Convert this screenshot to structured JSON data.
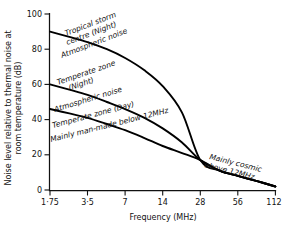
{
  "chart_data": {
    "type": "line",
    "title": "",
    "subtitle": "",
    "xlabel": "Frequency (MHz)",
    "ylabel": "Noise level relative to thermal noise at room temperature (dB)",
    "x_tick_labels": [
      "1·75",
      "3·5",
      "7",
      "14",
      "28",
      "56",
      "112"
    ],
    "x_tick_values": [
      1.75,
      3.5,
      7,
      14,
      28,
      56,
      112
    ],
    "x_scale": "log2",
    "xlim": [
      1.75,
      112
    ],
    "y_tick_labels": [
      "0",
      "20",
      "40",
      "60",
      "80",
      "100"
    ],
    "y_tick_values": [
      0,
      20,
      40,
      60,
      80,
      100
    ],
    "ylim": [
      0,
      100
    ],
    "grid": false,
    "legend": "none",
    "legend_position": "inline-annotations",
    "series": [
      {
        "name": "Tropical storm centre (Night) — Atmospheric noise",
        "x": [
          1.75,
          2.5,
          3.5,
          5,
          7,
          10,
          14,
          20,
          28,
          40,
          56,
          80,
          112
        ],
        "values": [
          90,
          87,
          84,
          80,
          75,
          68,
          59,
          44,
          17,
          11,
          8,
          5,
          2
        ]
      },
      {
        "name": "Temperate zone (Night) — Atmospheric noise",
        "x": [
          1.75,
          2.5,
          3.5,
          5,
          7,
          10,
          14,
          20,
          28,
          40,
          56,
          80,
          112
        ],
        "values": [
          60,
          57,
          54,
          50,
          46,
          41,
          35,
          27,
          17,
          11,
          8,
          5,
          2
        ]
      },
      {
        "name": "Temperate zone (Day) — Mainly man-made below 12MHz",
        "x": [
          1.75,
          2.5,
          3.5,
          5,
          7,
          10,
          14,
          20,
          28,
          40,
          56,
          80,
          112
        ],
        "values": [
          46,
          43.5,
          41,
          37.5,
          34,
          29.5,
          25,
          21,
          17,
          11,
          8,
          5,
          2
        ]
      }
    ],
    "annotations": [
      {
        "id": "tropical-storm-centre",
        "lines": [
          "Tropical storm",
          "centre (Night)"
        ],
        "x": 2.9,
        "y": 88,
        "rotation": -21
      },
      {
        "id": "atmospheric-noise-upper",
        "lines": [
          "Atmospheric noise"
        ],
        "x": 2.7,
        "y": 79,
        "rotation": -21
      },
      {
        "id": "temperate-zone-night",
        "lines": [
          "Temperate zone",
          "(Night)"
        ],
        "x": 2.6,
        "y": 62,
        "rotation": -19
      },
      {
        "id": "atmospheric-noise-lower",
        "lines": [
          "Atmospheric noise"
        ],
        "x": 2.4,
        "y": 49,
        "rotation": -17
      },
      {
        "id": "temperate-zone-day",
        "lines": [
          "Temperate zone (Day)"
        ],
        "x": 2.3,
        "y": 42,
        "rotation": -15
      },
      {
        "id": "mainly-man-made",
        "lines": [
          "Mainly man-made below 12MHz"
        ],
        "x": 2.2,
        "y": 35,
        "rotation": -14
      },
      {
        "id": "mainly-cosmic",
        "lines": [
          "Mainly cosmic",
          "above 12MHz"
        ],
        "x": 36,
        "y": 15,
        "rotation": 14
      }
    ]
  },
  "axes": {
    "x_title": "Frequency (MHz)",
    "y_title_line1": "Noise level relative to thermal noise at",
    "y_title_line2": "room temperature (dB)",
    "x_ticks": [
      "1·75",
      "3·5",
      "7",
      "14",
      "28",
      "56",
      "112"
    ],
    "y_ticks": [
      "100",
      "80",
      "60",
      "40",
      "20",
      "0"
    ]
  },
  "annotation_text": {
    "tropical_storm_l1": "Tropical storm",
    "tropical_storm_l2": "centre (Night)",
    "atmospheric_noise_upper": "Atmospheric noise",
    "temperate_night_l1": "Temperate zone",
    "temperate_night_l2": "(Night)",
    "atmospheric_noise_lower": "Atmospheric noise",
    "temperate_day": "Temperate zone (Day)",
    "man_made": "Mainly man-made below 12MHz",
    "cosmic_l1": "Mainly cosmic",
    "cosmic_l2": "above 12MHz"
  },
  "colors": {
    "background": "#ffffff",
    "ink": "#111111",
    "curve": "#000000"
  }
}
